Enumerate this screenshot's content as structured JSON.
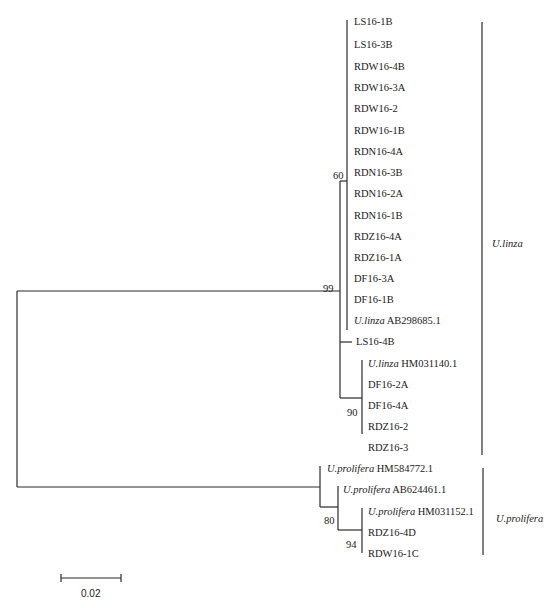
{
  "figure": {
    "type": "phylogenetic_tree",
    "leaves": [
      {
        "name": "LS16-1B",
        "species": "",
        "y": 22,
        "x": 354
      },
      {
        "name": "LS16-3B",
        "species": "",
        "y": 45,
        "x": 354
      },
      {
        "name": "RDW16-4B",
        "species": "",
        "y": 67,
        "x": 354
      },
      {
        "name": "RDW16-3A",
        "species": "",
        "y": 88,
        "x": 354
      },
      {
        "name": "RDW16-2",
        "species": "",
        "y": 109,
        "x": 354
      },
      {
        "name": "RDW16-1B",
        "species": "",
        "y": 131,
        "x": 354
      },
      {
        "name": "RDN16-4A",
        "species": "",
        "y": 152,
        "x": 354
      },
      {
        "name": "RDN16-3B",
        "species": "",
        "y": 173,
        "x": 354
      },
      {
        "name": "RDN16-2A",
        "species": "",
        "y": 194,
        "x": 354
      },
      {
        "name": "RDN16-1B",
        "species": "",
        "y": 216,
        "x": 354
      },
      {
        "name": "RDZ16-4A",
        "species": "",
        "y": 237,
        "x": 354
      },
      {
        "name": "RDZ16-1A",
        "species": "",
        "y": 258,
        "x": 354
      },
      {
        "name": "DF16-3A",
        "species": "",
        "y": 279,
        "x": 354
      },
      {
        "name": "DF16-1B",
        "species": "",
        "y": 300,
        "x": 354
      },
      {
        "name": "AB298685.1",
        "species": "U.linza",
        "y": 321,
        "x": 354
      },
      {
        "name": "LS16-4B",
        "species": "",
        "y": 342,
        "x": 356
      },
      {
        "name": "HM031140.1",
        "species": "U.linza",
        "y": 364,
        "x": 368
      },
      {
        "name": "DF16-2A",
        "species": "",
        "y": 385,
        "x": 368
      },
      {
        "name": "DF16-4A",
        "species": "",
        "y": 406,
        "x": 368
      },
      {
        "name": "RDZ16-2",
        "species": "",
        "y": 427,
        "x": 368
      },
      {
        "name": "RDZ16-3",
        "species": "",
        "y": 448,
        "x": 368
      },
      {
        "name": "HM584772.1",
        "species": "U.prolifera",
        "y": 469,
        "x": 327
      },
      {
        "name": "AB624461.1",
        "species": "U.prolifera",
        "y": 490,
        "x": 343
      },
      {
        "name": "HM031152.1",
        "species": "U.prolifera",
        "y": 512,
        "x": 368
      },
      {
        "name": "RDZ16-4D",
        "species": "",
        "y": 533,
        "x": 368
      },
      {
        "name": "RDW16-1C",
        "species": "",
        "y": 554,
        "x": 368
      }
    ],
    "bootstrap": [
      {
        "value": "60",
        "x": 333,
        "y": 170
      },
      {
        "value": "99",
        "x": 323,
        "y": 283
      },
      {
        "value": "90",
        "x": 347,
        "y": 407
      },
      {
        "value": "80",
        "x": 324,
        "y": 515
      },
      {
        "value": "94",
        "x": 346,
        "y": 539
      }
    ],
    "clades": [
      {
        "label": "U.linza",
        "bar_x": 482,
        "y1": 22,
        "y2": 455,
        "label_x": 492,
        "label_y": 238
      },
      {
        "label": "U.prolifera",
        "bar_x": 483,
        "y1": 468,
        "y2": 555,
        "label_x": 496,
        "label_y": 513
      }
    ],
    "scale_bar": {
      "label": "0.02",
      "x1": 61,
      "x2": 121,
      "y": 578,
      "label_x": 81,
      "label_y": 588
    },
    "branches": [
      {
        "x1": 17,
        "y1": 291,
        "x2": 17,
        "y2": 487
      },
      {
        "x1": 17,
        "y1": 291,
        "x2": 340,
        "y2": 291
      },
      {
        "x1": 17,
        "y1": 487,
        "x2": 320,
        "y2": 487
      },
      {
        "x1": 340,
        "y1": 181,
        "x2": 340,
        "y2": 398
      },
      {
        "x1": 340,
        "y1": 181,
        "x2": 347,
        "y2": 181
      },
      {
        "x1": 347,
        "y1": 20,
        "x2": 347,
        "y2": 330
      },
      {
        "x1": 340,
        "y1": 342,
        "x2": 352,
        "y2": 342
      },
      {
        "x1": 340,
        "y1": 398,
        "x2": 362,
        "y2": 398
      },
      {
        "x1": 362,
        "y1": 360,
        "x2": 362,
        "y2": 434
      },
      {
        "x1": 320,
        "y1": 466,
        "x2": 320,
        "y2": 507
      },
      {
        "x1": 320,
        "y1": 507,
        "x2": 338,
        "y2": 507
      },
      {
        "x1": 338,
        "y1": 486,
        "x2": 338,
        "y2": 530
      },
      {
        "x1": 338,
        "y1": 530,
        "x2": 362,
        "y2": 530
      },
      {
        "x1": 362,
        "y1": 508,
        "x2": 362,
        "y2": 553
      }
    ],
    "line_color": "#2a2a2a",
    "grey_line_color": "#888888"
  }
}
